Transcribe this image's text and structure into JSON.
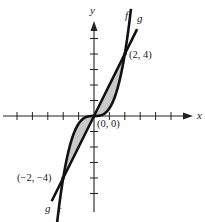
{
  "figure": {
    "axes": {
      "x_label": "x",
      "y_label": "y",
      "x_ticks": [
        -5,
        -4,
        -3,
        -2,
        -1,
        1,
        2,
        3,
        4,
        5
      ],
      "y_ticks": [
        -5,
        -4,
        -3,
        -2,
        -1,
        1,
        2,
        3,
        4,
        5
      ],
      "x_range": [
        -6,
        6.4
      ],
      "y_range": [
        -6.2,
        6.2
      ]
    },
    "curves": [
      {
        "name": "f",
        "label": "f",
        "description": "cubic curve"
      },
      {
        "name": "g",
        "label": "g",
        "description": "straight line"
      }
    ],
    "points": [
      {
        "label": "(2, 4)",
        "x": 2,
        "y": 4
      },
      {
        "label": "(0, 0)",
        "x": 0,
        "y": 0
      },
      {
        "label": "(−2, −4)",
        "x": -2,
        "y": -4
      }
    ],
    "shaded_region": "area enclosed between f and g from x = −2 to x = 2",
    "colors": {
      "stroke": "#111111",
      "shade": "#c8c8c8",
      "background": "#ffffff"
    }
  }
}
